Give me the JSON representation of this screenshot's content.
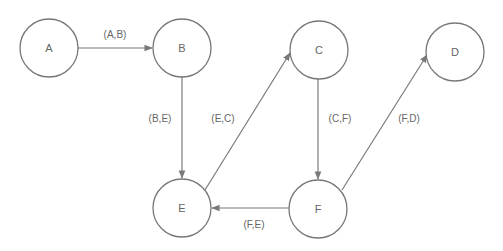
{
  "diagram": {
    "type": "directed-graph",
    "colors": {
      "stroke": "#777777",
      "text": "#666666",
      "background": "#ffffff"
    },
    "nodes": [
      {
        "id": "A",
        "label": "A",
        "cx": 49,
        "cy": 48
      },
      {
        "id": "B",
        "label": "B",
        "cx": 182,
        "cy": 48
      },
      {
        "id": "C",
        "label": "C",
        "cx": 319,
        "cy": 50
      },
      {
        "id": "D",
        "label": "D",
        "cx": 455,
        "cy": 52
      },
      {
        "id": "E",
        "label": "E",
        "cx": 182,
        "cy": 208
      },
      {
        "id": "F",
        "label": "F",
        "cx": 318,
        "cy": 209
      }
    ],
    "edges": [
      {
        "from": "A",
        "to": "B",
        "label": "(A,B)"
      },
      {
        "from": "B",
        "to": "E",
        "label": "(B,E)"
      },
      {
        "from": "E",
        "to": "C",
        "label": "(E,C)"
      },
      {
        "from": "C",
        "to": "F",
        "label": "(C,F)"
      },
      {
        "from": "F",
        "to": "D",
        "label": "(F,D)"
      },
      {
        "from": "F",
        "to": "E",
        "label": "(F,E)"
      }
    ]
  }
}
